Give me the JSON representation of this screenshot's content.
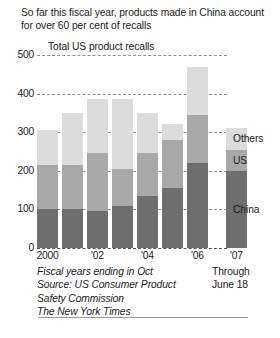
{
  "headline": "So far this fiscal year, products made in China account for over 60 per cent of recalls",
  "chart_title": "Total US product recalls",
  "footnote": {
    "line1": "Fiscal years ending in Oct",
    "line2": "Source: US Consumer Product",
    "line3": "Safety Commission",
    "line4": "The New York Times"
  },
  "through": {
    "line1": "Through",
    "line2": "June 18"
  },
  "colors": {
    "others": "#dcdcdc",
    "us": "#a8a8a8",
    "china": "#6e6e6e",
    "gridline": "#8f8f8f",
    "text": "#1a1a1a"
  },
  "chart_data": {
    "type": "bar",
    "stacked": true,
    "title": "Total US product recalls",
    "xlabel": "",
    "ylabel": "",
    "ylim": [
      0,
      500
    ],
    "yticks": [
      0,
      100,
      200,
      300,
      400,
      500
    ],
    "ytick_labels": [
      "0",
      "100",
      "200",
      "300",
      "400",
      "500"
    ],
    "grid": true,
    "legend_position": "right",
    "categories": [
      "2000",
      "2001",
      "2002",
      "2003",
      "2004",
      "2005",
      "2006",
      "2007"
    ],
    "xtick_labels": [
      "2000",
      "'02",
      "'04",
      "'06",
      "'07"
    ],
    "xtick_categories": [
      "2000",
      "2002",
      "2004",
      "2006",
      "2007"
    ],
    "series": [
      {
        "name": "China",
        "values": [
          100,
          100,
          95,
          110,
          135,
          155,
          220,
          200
        ]
      },
      {
        "name": "US",
        "values": [
          115,
          115,
          150,
          95,
          110,
          125,
          125,
          55
        ]
      },
      {
        "name": "Others",
        "values": [
          90,
          135,
          140,
          180,
          105,
          40,
          125,
          55
        ]
      }
    ],
    "totals": [
      305,
      350,
      385,
      385,
      350,
      320,
      470,
      310
    ],
    "annotations": [
      "Through June 18 for 2007",
      "Fiscal years ending in Oct"
    ]
  }
}
